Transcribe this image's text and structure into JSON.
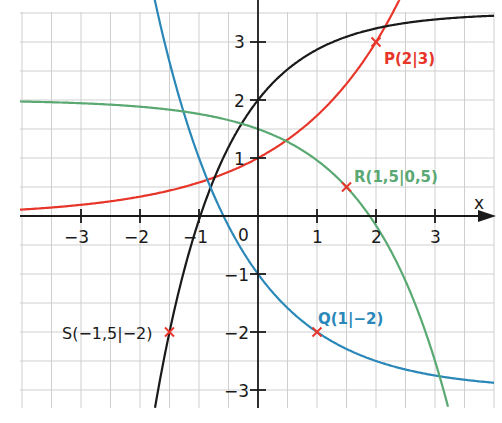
{
  "chart_data": {
    "type": "line",
    "title": "",
    "xlabel": "x",
    "ylabel": "y",
    "xlim": [
      -4.0,
      4.0
    ],
    "ylim": [
      -3.3,
      3.7
    ],
    "grid": true,
    "grid_step": 0.5,
    "x_ticks": [
      "-3",
      "-2",
      "-1",
      "0",
      "1",
      "2",
      "3"
    ],
    "y_ticks": [
      "3",
      "2",
      "1",
      "-1",
      "-2",
      "-3"
    ],
    "origin_label": "0",
    "series": [
      {
        "name": "red",
        "color": "#e8352a",
        "formula": "f(x)=(√3)^x",
        "points": [
          [
            -4,
            0.11
          ],
          [
            -2,
            0.33
          ],
          [
            -1,
            0.58
          ],
          [
            0,
            1
          ],
          [
            1,
            1.73
          ],
          [
            2,
            3
          ],
          [
            2.3,
            3.54
          ]
        ],
        "marked_point": {
          "label": "P(2|3)",
          "x": 2,
          "y": 3
        }
      },
      {
        "name": "black",
        "color": "#1a1a1a",
        "formula": "f(x)=3.5-1.5·2.378^(-x)",
        "points": [
          [
            -1.75,
            -2.95
          ],
          [
            -1.5,
            -2
          ],
          [
            -1,
            -0.07
          ],
          [
            0,
            2
          ],
          [
            1,
            2.87
          ],
          [
            2,
            3.23
          ],
          [
            4,
            3.45
          ]
        ],
        "marked_point": {
          "label": "S(-1,5|-2)",
          "x": -1.5,
          "y": -2
        }
      },
      {
        "name": "blue",
        "color": "#2a87b8",
        "formula": "f(x)=-3+2·2^(-x)",
        "points": [
          [
            -1.7,
            3.5
          ],
          [
            -1,
            1
          ],
          [
            0,
            -1
          ],
          [
            1,
            -2
          ],
          [
            2,
            -2.5
          ],
          [
            3,
            -2.75
          ],
          [
            4,
            -2.87
          ]
        ],
        "marked_point": {
          "label": "Q(1|-2)",
          "x": 1,
          "y": -2
        }
      },
      {
        "name": "green",
        "color": "#5aa872",
        "formula": "f(x)=2-0.5·2.08^x",
        "points": [
          [
            -4,
            1.97
          ],
          [
            -2,
            1.88
          ],
          [
            0,
            1.5
          ],
          [
            1,
            0.96
          ],
          [
            1.5,
            0.5
          ],
          [
            2,
            -0.16
          ],
          [
            3,
            -2.5
          ],
          [
            3.3,
            -3.3
          ]
        ],
        "marked_point": {
          "label": "R(1,5|0,5)",
          "x": 1.5,
          "y": 0.5
        }
      }
    ]
  },
  "labels": {
    "P": "P(2|3)",
    "Q": "Q(1|−2)",
    "R": "R(1,5|0,5)",
    "S": "S(−1,5|−2)",
    "x_axis": "x",
    "origin": "0",
    "xt": {
      "m3": "−3",
      "m2": "−2",
      "m1": "−1",
      "p1": "1",
      "p2": "2",
      "p3": "3"
    },
    "yt": {
      "p3": "3",
      "p2": "2",
      "p1": "1",
      "m1": "−1",
      "m2": "−2",
      "m3": "−3"
    }
  },
  "colors": {
    "red": "#e8352a",
    "black": "#1a1a1a",
    "blue": "#2a87b8",
    "green": "#5aa872",
    "grid": "#c8c8c8",
    "mark": "#e8352a"
  }
}
